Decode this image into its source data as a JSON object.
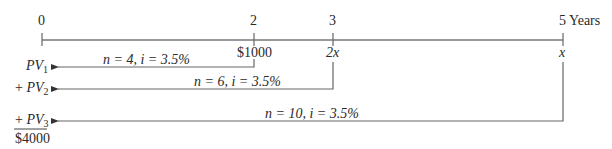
{
  "timeline": {
    "ticks": [
      {
        "label": "0",
        "x": 42
      },
      {
        "label": "2",
        "x": 254
      },
      {
        "label": "3",
        "x": 333
      },
      {
        "label": "5 Years",
        "x": 563
      }
    ],
    "cash_flows": [
      {
        "at": "2",
        "amount": "$1000"
      },
      {
        "at": "3",
        "amount": "2x"
      },
      {
        "at": "5",
        "amount": "x"
      }
    ]
  },
  "arrows": [
    {
      "n": "4",
      "i": "3.5%",
      "label": "n = 4, i = 3.5%",
      "pv_prefix": "",
      "pv": "PV",
      "pv_sub": "1"
    },
    {
      "n": "6",
      "i": "3.5%",
      "label": "n = 6, i = 3.5%",
      "pv_prefix": "+ ",
      "pv": "PV",
      "pv_sub": "2"
    },
    {
      "n": "10",
      "i": "3.5%",
      "label": "n = 10, i = 3.5%",
      "pv_prefix": "+ ",
      "pv": "PV",
      "pv_sub": "3"
    }
  ],
  "total": "$4000",
  "colors": {
    "line": "#555555",
    "text": "#2a2a2a"
  }
}
